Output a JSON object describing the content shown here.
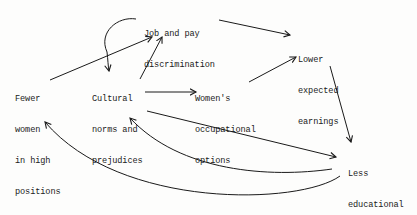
{
  "diagram": {
    "type": "causal-loop",
    "colors": {
      "background": "#fdfdfc",
      "ink": "#1a1a1a"
    },
    "nodes": [
      {
        "id": "job_pay",
        "lines": [
          "Job and pay",
          "discrimination"
        ]
      },
      {
        "id": "lower_earnings",
        "lines": [
          "Lower",
          "expected",
          "earnings"
        ]
      },
      {
        "id": "fewer_women",
        "lines": [
          "Fewer",
          "women",
          "in high",
          "positions"
        ]
      },
      {
        "id": "cultural_norms",
        "lines": [
          "Cultural",
          "norms and",
          "prejudices"
        ]
      },
      {
        "id": "occupational_options",
        "lines": [
          "Women's",
          "occupational",
          "options"
        ]
      },
      {
        "id": "less_education",
        "lines": [
          "Less",
          "educational",
          "investment"
        ]
      }
    ],
    "edges": [
      {
        "from": "fewer_women",
        "to": "job_pay",
        "style": "straight"
      },
      {
        "from": "job_pay",
        "to": "cultural_norms",
        "style": "curved"
      },
      {
        "from": "cultural_norms",
        "to": "job_pay",
        "style": "straight"
      },
      {
        "from": "job_pay",
        "to": "lower_earnings",
        "style": "straight"
      },
      {
        "from": "cultural_norms",
        "to": "occupational_options",
        "style": "straight"
      },
      {
        "from": "occupational_options",
        "to": "lower_earnings",
        "style": "straight"
      },
      {
        "from": "lower_earnings",
        "to": "less_education",
        "style": "straight"
      },
      {
        "from": "cultural_norms",
        "to": "less_education",
        "style": "straight"
      },
      {
        "from": "less_education",
        "to": "cultural_norms",
        "style": "curved"
      },
      {
        "from": "less_education",
        "to": "fewer_women",
        "style": "curved"
      }
    ]
  }
}
